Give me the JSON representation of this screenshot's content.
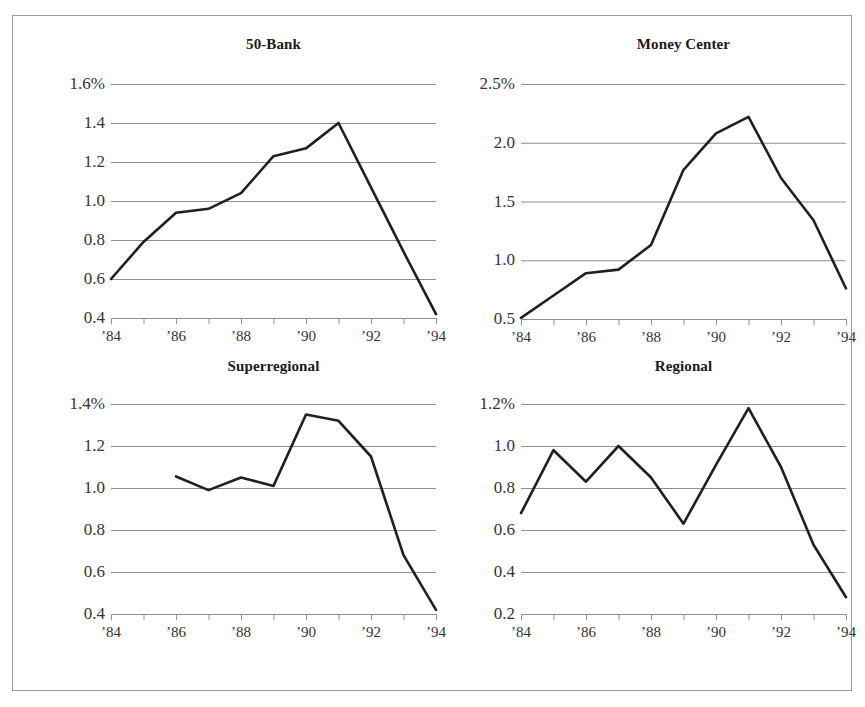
{
  "figure": {
    "panel_count": 4,
    "background": "#ffffff",
    "border_color": "#9a9a9a",
    "line_color": "#231f20",
    "gridline_color": "#8f8f8f"
  },
  "chart_data": [
    {
      "type": "line",
      "title": "50-Bank",
      "xlabel": "",
      "ylabel": "",
      "ylim": [
        0.4,
        1.6
      ],
      "yticks": [
        0.4,
        0.6,
        0.8,
        1.0,
        1.2,
        1.4,
        1.6
      ],
      "ytick_labels": [
        "0.4",
        "0.6",
        "0.8",
        "1.0",
        "1.2",
        "1.4",
        "1.6%"
      ],
      "xlim": [
        1984,
        1994
      ],
      "xticks": [
        1984,
        1985,
        1986,
        1987,
        1988,
        1989,
        1990,
        1991,
        1992,
        1993,
        1994
      ],
      "xtick_labels": [
        "’84",
        "",
        "’86",
        "",
        "’88",
        "",
        "’90",
        "",
        "’92",
        "",
        "’94"
      ],
      "grid": "horizontal",
      "legend": "none",
      "x": [
        1984,
        1985,
        1986,
        1987,
        1988,
        1989,
        1990,
        1991,
        1992,
        1993,
        1994
      ],
      "values": [
        0.6,
        0.79,
        0.94,
        0.96,
        1.04,
        1.23,
        1.27,
        1.4,
        1.07,
        0.74,
        0.42
      ]
    },
    {
      "type": "line",
      "title": "Money Center",
      "xlabel": "",
      "ylabel": "",
      "ylim": [
        0.5,
        2.5
      ],
      "yticks": [
        0.5,
        1.0,
        1.5,
        2.0,
        2.5
      ],
      "ytick_labels": [
        "0.5",
        "1.0",
        "1.5",
        "2.0",
        "2.5%"
      ],
      "xlim": [
        1984,
        1994
      ],
      "xticks": [
        1984,
        1985,
        1986,
        1987,
        1988,
        1989,
        1990,
        1991,
        1992,
        1993,
        1994
      ],
      "xtick_labels": [
        "’84",
        "",
        "’86",
        "",
        "’88",
        "",
        "’90",
        "",
        "’92",
        "",
        "’94"
      ],
      "grid": "horizontal",
      "legend": "none",
      "x": [
        1984,
        1985,
        1986,
        1987,
        1988,
        1989,
        1990,
        1991,
        1992,
        1993,
        1994
      ],
      "values": [
        0.51,
        0.7,
        0.89,
        0.92,
        1.13,
        1.77,
        2.08,
        2.22,
        1.7,
        1.34,
        0.76
      ]
    },
    {
      "type": "line",
      "title": "Superregional",
      "xlabel": "",
      "ylabel": "",
      "ylim": [
        0.4,
        1.4
      ],
      "yticks": [
        0.4,
        0.6,
        0.8,
        1.0,
        1.2,
        1.4
      ],
      "ytick_labels": [
        "0.4",
        "0.6",
        "0.8",
        "1.0",
        "1.2",
        "1.4%"
      ],
      "xlim": [
        1984,
        1994
      ],
      "xticks": [
        1984,
        1985,
        1986,
        1987,
        1988,
        1989,
        1990,
        1991,
        1992,
        1993,
        1994
      ],
      "xtick_labels": [
        "’84",
        "",
        "’86",
        "",
        "’88",
        "",
        "’90",
        "",
        "’92",
        "",
        "’94"
      ],
      "grid": "horizontal",
      "legend": "none",
      "x": [
        1986,
        1987,
        1988,
        1989,
        1990,
        1991,
        1992,
        1993,
        1994
      ],
      "values": [
        1.055,
        0.99,
        1.05,
        1.01,
        1.35,
        1.32,
        1.15,
        0.68,
        0.42
      ]
    },
    {
      "type": "line",
      "title": "Regional",
      "xlabel": "",
      "ylabel": "",
      "ylim": [
        0.2,
        1.2
      ],
      "yticks": [
        0.2,
        0.4,
        0.6,
        0.8,
        1.0,
        1.2
      ],
      "ytick_labels": [
        "0.2",
        "0.4",
        "0.6",
        "0.8",
        "1.0",
        "1.2%"
      ],
      "xlim": [
        1984,
        1994
      ],
      "xticks": [
        1984,
        1985,
        1986,
        1987,
        1988,
        1989,
        1990,
        1991,
        1992,
        1993,
        1994
      ],
      "xtick_labels": [
        "’84",
        "",
        "’86",
        "",
        "’88",
        "",
        "’90",
        "",
        "’92",
        "",
        "’94"
      ],
      "grid": "horizontal",
      "legend": "none",
      "x": [
        1984,
        1985,
        1986,
        1987,
        1988,
        1989,
        1990,
        1991,
        1992,
        1993,
        1994
      ],
      "values": [
        0.68,
        0.98,
        0.83,
        1.0,
        0.85,
        0.63,
        0.91,
        1.18,
        0.9,
        0.53,
        0.28
      ]
    }
  ]
}
